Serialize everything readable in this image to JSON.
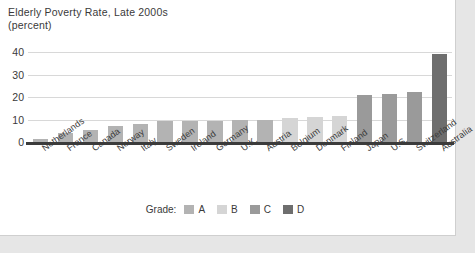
{
  "card": {
    "background": "#ffffff",
    "page_background": "#e6e6e6"
  },
  "footer": {
    "text": ""
  },
  "legend": {
    "title": "Grade:",
    "items": [
      {
        "label": "A",
        "color": "#b3b3b3"
      },
      {
        "label": "B",
        "color": "#d5d5d5"
      },
      {
        "label": "C",
        "color": "#9a9a9a"
      },
      {
        "label": "D",
        "color": "#6e6e6e"
      }
    ]
  },
  "grade_colors": {
    "A": "#b3b3b3",
    "B": "#d5d5d5",
    "C": "#9a9a9a",
    "D": "#6e6e6e"
  },
  "chart_data": {
    "type": "bar",
    "title": "Elderly Poverty Rate, Late 2000s",
    "subtitle": "(percent)",
    "xlabel": "",
    "ylabel": "",
    "ylim": [
      0,
      40
    ],
    "yticks": [
      0,
      10,
      20,
      30,
      40
    ],
    "grid": true,
    "legend_position": "bottom-center",
    "categories": [
      "Netherlands",
      "France",
      "Canada",
      "Norway",
      "Italy",
      "Sweden",
      "Ireland",
      "Germany",
      "U.K.",
      "Austria",
      "Belgium",
      "Denmark",
      "Finland",
      "Japan",
      "U.S.",
      "Switzerland",
      "Australia"
    ],
    "values": [
      1.5,
      4.2,
      5.5,
      7.0,
      8.2,
      9.2,
      9.3,
      9.5,
      9.6,
      9.8,
      10.8,
      10.9,
      11.5,
      21.0,
      21.3,
      22.3,
      39.0
    ],
    "grades": [
      "A",
      "A",
      "A",
      "A",
      "A",
      "A",
      "A",
      "A",
      "A",
      "A",
      "B",
      "B",
      "B",
      "C",
      "C",
      "C",
      "D"
    ]
  }
}
